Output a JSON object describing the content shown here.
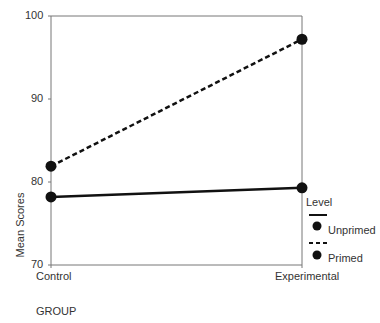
{
  "chart_data": {
    "type": "line",
    "title": "",
    "xlabel": "GROUP",
    "ylabel": "Mean Scores",
    "categories": [
      "Control",
      "Experimental"
    ],
    "ylim": [
      70,
      100
    ],
    "yticks": [
      "100",
      "90",
      "80",
      "70"
    ],
    "grid": false,
    "legend_position": "right",
    "legend_title": "Level",
    "series": [
      {
        "name": "Unprimed",
        "style": "solid",
        "values": [
          78.2,
          79.3
        ]
      },
      {
        "name": "Primed",
        "style": "dashed",
        "values": [
          81.9,
          97.2
        ]
      }
    ]
  }
}
